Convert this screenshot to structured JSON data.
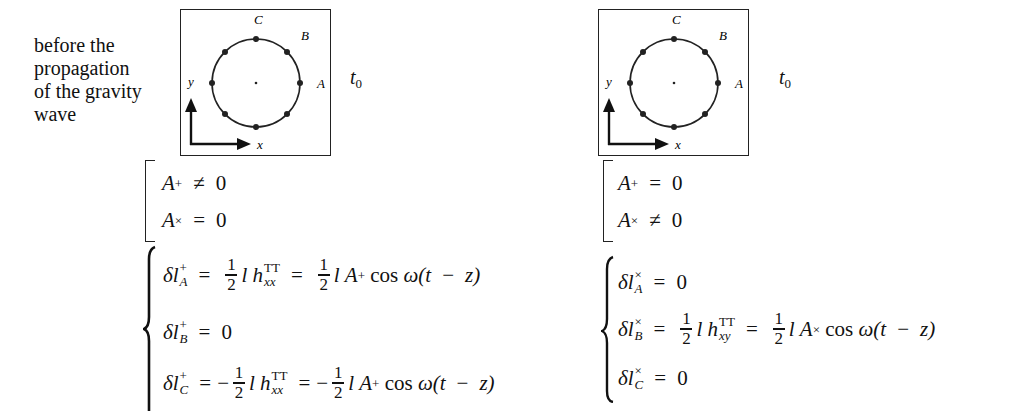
{
  "caption": {
    "lines": [
      "before the",
      "propagation",
      "of the gravity",
      "wave"
    ]
  },
  "diagrams": [
    {
      "labels": {
        "A": "A",
        "B": "B",
        "C": "C",
        "x": "x",
        "y": "y"
      },
      "time_label": "t",
      "time_sub": "0"
    },
    {
      "labels": {
        "A": "A",
        "B": "B",
        "C": "C",
        "x": "x",
        "y": "y"
      },
      "time_label": "t",
      "time_sub": "0"
    }
  ],
  "left": {
    "conditions": [
      {
        "var": "A",
        "sub": "+",
        "rel": "≠",
        "rhs": "0"
      },
      {
        "var": "A",
        "sub": "×",
        "rel": "=",
        "rhs": "0"
      }
    ],
    "equations": [
      {
        "lhs": "δl",
        "sup": "+",
        "sub": "A",
        "text": "= ½ l h^TT_xx = ½ l A₊ cos ω(t − z)"
      },
      {
        "lhs": "δl",
        "sup": "+",
        "sub": "B",
        "text": "= 0"
      },
      {
        "lhs": "δl",
        "sup": "+",
        "sub": "C",
        "text": "= −½ l h^TT_xx = −½ l A₊ cos ω(t − z)"
      }
    ],
    "pieces": {
      "eq": "=",
      "minus": "−",
      "one": "1",
      "two": "2",
      "l": "l",
      "h": "h",
      "TT": "TT",
      "xx": "xx",
      "A": "A",
      "plus": "+",
      "cos": "cos",
      "omega": "ω(",
      "t": "t",
      "z": "z)",
      "zero": "0"
    }
  },
  "right": {
    "conditions": [
      {
        "var": "A",
        "sub": "+",
        "rel": "=",
        "rhs": "0"
      },
      {
        "var": "A",
        "sub": "×",
        "rel": "≠",
        "rhs": "0"
      }
    ],
    "equations": [
      {
        "lhs": "δl",
        "sup": "×",
        "sub": "A",
        "text": "= 0"
      },
      {
        "lhs": "δl",
        "sup": "×",
        "sub": "B",
        "text": "= ½ l h^TT_xy = ½ l A× cos ω(t − z)"
      },
      {
        "lhs": "δl",
        "sup": "×",
        "sub": "C",
        "text": "= 0"
      }
    ],
    "pieces": {
      "eq": "=",
      "one": "1",
      "two": "2",
      "l": "l",
      "h": "h",
      "TT": "TT",
      "xy": "xy",
      "A": "A",
      "times": "×",
      "cos": "cos",
      "omega": "ω(",
      "t": "t",
      "z": "z)",
      "zero": "0"
    }
  }
}
